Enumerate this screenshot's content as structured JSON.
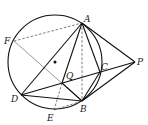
{
  "diagram": {
    "type": "geometry",
    "circle": {
      "cx": 55,
      "cy": 62,
      "r": 47
    },
    "center_dot": {
      "x": 55,
      "y": 62
    },
    "points": {
      "A": {
        "x": 82,
        "y": 23,
        "label": "A",
        "lx": 84,
        "ly": 22
      },
      "F": {
        "x": 14,
        "y": 41,
        "label": "F",
        "lx": 4,
        "ly": 44
      },
      "P": {
        "x": 135,
        "y": 62,
        "label": "P",
        "lx": 137,
        "ly": 65
      },
      "C": {
        "x": 100,
        "y": 72,
        "label": "C",
        "lx": 101,
        "ly": 70
      },
      "Q": {
        "x": 62,
        "y": 83,
        "label": "Q",
        "lx": 66,
        "ly": 79
      },
      "D": {
        "x": 21,
        "y": 95,
        "label": "D",
        "lx": 11,
        "ly": 102
      },
      "B": {
        "x": 82,
        "y": 101,
        "label": "B",
        "lx": 80,
        "ly": 112
      },
      "E": {
        "x": 54,
        "y": 110,
        "label": "E",
        "lx": 47,
        "ly": 121
      }
    },
    "labels": [
      "A",
      "F",
      "P",
      "C",
      "Q",
      "D",
      "B",
      "E"
    ],
    "solid_lines": [
      [
        "A",
        "P"
      ],
      [
        "P",
        "B"
      ],
      [
        "D",
        "P"
      ],
      [
        "A",
        "D"
      ],
      [
        "A",
        "Q"
      ],
      [
        "A",
        "C"
      ],
      [
        "D",
        "B"
      ],
      [
        "C",
        "B"
      ],
      [
        "Q",
        "B"
      ]
    ],
    "thin_lines": [
      [
        "F",
        "B"
      ]
    ],
    "dashed_lines": [
      [
        "F",
        "A"
      ],
      [
        "A",
        "B"
      ],
      [
        "Q",
        "E"
      ],
      [
        "E",
        "B"
      ]
    ]
  }
}
